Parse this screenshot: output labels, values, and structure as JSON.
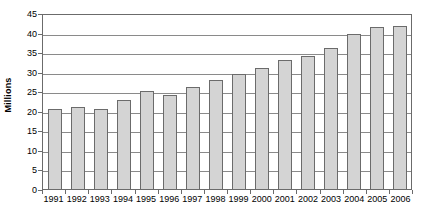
{
  "chart_data": {
    "type": "bar",
    "title": "",
    "xlabel": "",
    "ylabel": "Millions",
    "ylim": [
      0,
      45
    ],
    "yticks": [
      0,
      5,
      10,
      15,
      20,
      25,
      30,
      35,
      40,
      45
    ],
    "ytick_labels": [
      "0",
      "5",
      "10",
      "15",
      "20",
      "25",
      "30",
      "35",
      "40",
      "45"
    ],
    "grid": "horizontal",
    "legend": "none",
    "bar_color": "#d4d4d4",
    "bar_border_color": "#6b6b6b",
    "axis_color": "#6b6b6b",
    "gridline_color": "#8a8a8a",
    "categories": [
      "1991",
      "1992",
      "1993",
      "1994",
      "1995",
      "1996",
      "1997",
      "1998",
      "1999",
      "2000",
      "2001",
      "2002",
      "2003",
      "2004",
      "2005",
      "2006"
    ],
    "values": [
      20.5,
      21.0,
      20.5,
      22.7,
      25.0,
      24.0,
      26.0,
      28.0,
      29.3,
      31.0,
      33.0,
      34.0,
      36.0,
      39.7,
      41.4,
      41.7
    ]
  }
}
